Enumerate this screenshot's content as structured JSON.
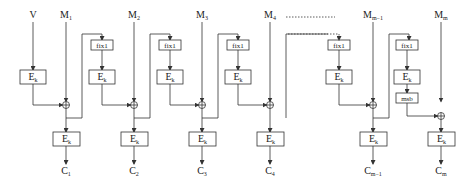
{
  "diagram": {
    "type": "cbc-mac-style encryption chain",
    "inputs": {
      "iv": "V",
      "messages": [
        {
          "base": "M",
          "sub": "1"
        },
        {
          "base": "M",
          "sub": "2"
        },
        {
          "base": "M",
          "sub": "3"
        },
        {
          "base": "M",
          "sub": "4"
        },
        {
          "base": "M",
          "sub": "m−1"
        },
        {
          "base": "M",
          "sub": "m"
        }
      ]
    },
    "outputs": [
      {
        "base": "C",
        "sub": "1"
      },
      {
        "base": "C",
        "sub": "2"
      },
      {
        "base": "C",
        "sub": "3"
      },
      {
        "base": "C",
        "sub": "4"
      },
      {
        "base": "C",
        "sub": "m−1"
      },
      {
        "base": "C",
        "sub": "m"
      }
    ],
    "blocks": {
      "encrypt": {
        "base": "E",
        "sub": "k"
      },
      "fix": "fix1",
      "msb": "msb"
    },
    "xor_symbol": "⊕"
  }
}
